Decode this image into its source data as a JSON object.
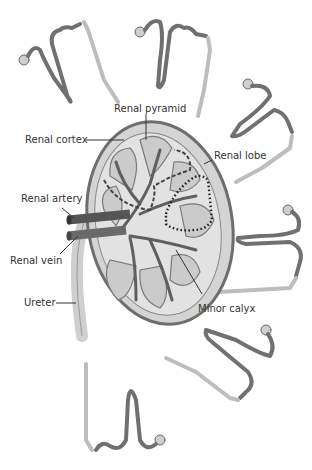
{
  "diagram": {
    "labels": {
      "renal_pyramid": "Renal pyramid",
      "renal_cortex": "Renal cortex",
      "renal_lobe": "Renal lobe",
      "renal_artery": "Renal artery",
      "renal_vein": "Renal vein",
      "ureter": "Ureter",
      "minor_calyx": "Minor calyx"
    },
    "colors": {
      "kidney_fill": "#d9d9d9",
      "kidney_outline": "#6e6e6e",
      "pyramid_fill": "#c8c8c8",
      "vessel": "#5a5a5a",
      "nephron_dark": "#707070",
      "collecting_duct": "#b8b8b8",
      "label_text": "#333333"
    }
  }
}
